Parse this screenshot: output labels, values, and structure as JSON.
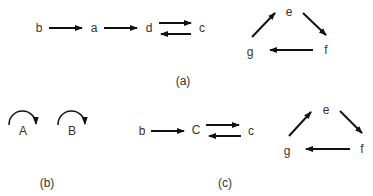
{
  "panels": {
    "a": {
      "caption": "(a)",
      "chain": [
        "b",
        "a",
        "d",
        "c"
      ],
      "cycle": [
        "e",
        "f",
        "g"
      ],
      "edges": [
        {
          "from": "b",
          "to": "a"
        },
        {
          "from": "a",
          "to": "d"
        },
        {
          "from": "d",
          "to": "c"
        },
        {
          "from": "c",
          "to": "d"
        },
        {
          "from": "e",
          "to": "f"
        },
        {
          "from": "f",
          "to": "g"
        },
        {
          "from": "g",
          "to": "e"
        }
      ]
    },
    "b": {
      "caption": "(b)",
      "nodes": [
        "A",
        "B"
      ],
      "self_loops": [
        "A",
        "B"
      ]
    },
    "c": {
      "caption": "(c)",
      "chain": [
        "b",
        "C",
        "c"
      ],
      "cycle": [
        "e",
        "f",
        "g"
      ],
      "edges": [
        {
          "from": "b",
          "to": "C"
        },
        {
          "from": "C",
          "to": "c"
        },
        {
          "from": "c",
          "to": "C"
        },
        {
          "from": "e",
          "to": "f"
        },
        {
          "from": "f",
          "to": "g"
        },
        {
          "from": "g",
          "to": "e"
        }
      ]
    }
  }
}
